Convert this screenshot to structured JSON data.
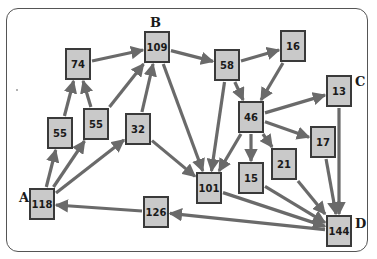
{
  "diagram": {
    "type": "directed-graph",
    "node_fill": "#c9c9c9",
    "node_border": "#3a3a3a",
    "edge_color": "#6a6a6a",
    "labels": [
      {
        "id": "A",
        "text": "A",
        "node": "n118"
      },
      {
        "id": "B",
        "text": "B",
        "node": "n109"
      },
      {
        "id": "C",
        "text": "C",
        "node": "n13"
      },
      {
        "id": "D",
        "text": "D",
        "node": "n144"
      }
    ],
    "nodes": [
      {
        "id": "n118",
        "value": "118",
        "x": 42,
        "y": 204
      },
      {
        "id": "n55a",
        "value": "55",
        "x": 60,
        "y": 133
      },
      {
        "id": "n55b",
        "value": "55",
        "x": 96,
        "y": 124
      },
      {
        "id": "n74",
        "value": "74",
        "x": 78,
        "y": 64
      },
      {
        "id": "n32",
        "value": "32",
        "x": 138,
        "y": 129
      },
      {
        "id": "n109",
        "value": "109",
        "x": 157,
        "y": 47
      },
      {
        "id": "n58",
        "value": "58",
        "x": 227,
        "y": 65
      },
      {
        "id": "n16",
        "value": "16",
        "x": 293,
        "y": 46
      },
      {
        "id": "n46",
        "value": "46",
        "x": 251,
        "y": 117
      },
      {
        "id": "n13",
        "value": "13",
        "x": 339,
        "y": 91
      },
      {
        "id": "n17",
        "value": "17",
        "x": 323,
        "y": 142
      },
      {
        "id": "n21",
        "value": "21",
        "x": 284,
        "y": 164
      },
      {
        "id": "n15",
        "value": "15",
        "x": 251,
        "y": 178
      },
      {
        "id": "n101",
        "value": "101",
        "x": 209,
        "y": 188
      },
      {
        "id": "n126",
        "value": "126",
        "x": 156,
        "y": 212
      },
      {
        "id": "n144",
        "value": "144",
        "x": 339,
        "y": 231
      }
    ],
    "edges": [
      {
        "from": "n118",
        "to": "n55a"
      },
      {
        "from": "n118",
        "to": "n55b"
      },
      {
        "from": "n118",
        "to": "n32"
      },
      {
        "from": "n55a",
        "to": "n74"
      },
      {
        "from": "n55b",
        "to": "n74"
      },
      {
        "from": "n55b",
        "to": "n109"
      },
      {
        "from": "n74",
        "to": "n109"
      },
      {
        "from": "n32",
        "to": "n109"
      },
      {
        "from": "n32",
        "to": "n101"
      },
      {
        "from": "n109",
        "to": "n58"
      },
      {
        "from": "n109",
        "to": "n101"
      },
      {
        "from": "n58",
        "to": "n16"
      },
      {
        "from": "n58",
        "to": "n46"
      },
      {
        "from": "n58",
        "to": "n101"
      },
      {
        "from": "n16",
        "to": "n46"
      },
      {
        "from": "n46",
        "to": "n13"
      },
      {
        "from": "n46",
        "to": "n17"
      },
      {
        "from": "n46",
        "to": "n21"
      },
      {
        "from": "n46",
        "to": "n15"
      },
      {
        "from": "n46",
        "to": "n101"
      },
      {
        "from": "n13",
        "to": "n144"
      },
      {
        "from": "n17",
        "to": "n144"
      },
      {
        "from": "n21",
        "to": "n144"
      },
      {
        "from": "n15",
        "to": "n144"
      },
      {
        "from": "n101",
        "to": "n144"
      },
      {
        "from": "n144",
        "to": "n126"
      },
      {
        "from": "n126",
        "to": "n118"
      }
    ]
  }
}
